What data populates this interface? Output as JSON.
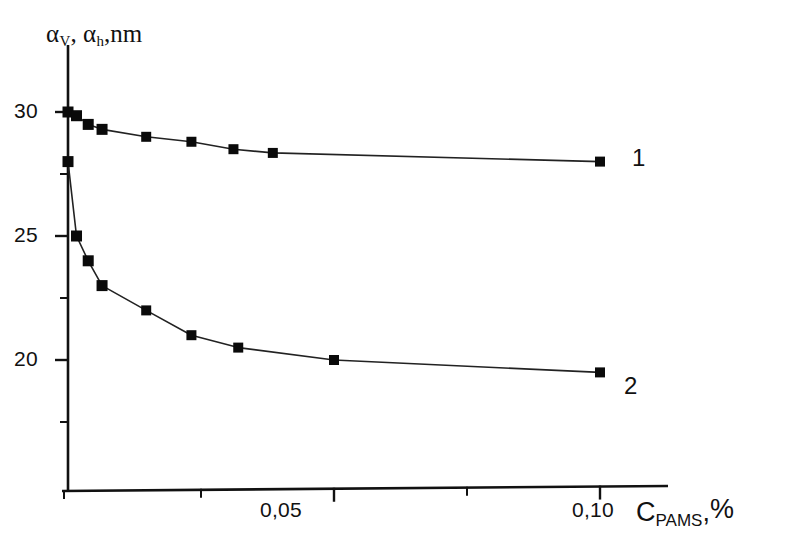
{
  "chart_data": {
    "type": "line",
    "title": "",
    "subtitle": "",
    "xlabel": "C_PAMS, %",
    "ylabel": "alpha_v, alpha_h, nm",
    "xlim": [
      0.0,
      0.1125
    ],
    "ylim": [
      16.25,
      32.0
    ],
    "grid": false,
    "legend_position": "inline-right-end-labels",
    "x_major_ticks": [
      0.05,
      0.1
    ],
    "x_major_tick_labels": [
      "0,05",
      "0,10"
    ],
    "x_minor_ticks": [
      0.025,
      0.075
    ],
    "y_major_ticks": [
      30,
      25,
      20
    ],
    "y_major_tick_labels": [
      "30",
      "25",
      "20"
    ],
    "y_minor_ticks": [
      27.5,
      22.5,
      17.5
    ],
    "series": [
      {
        "name": "1",
        "label": "1",
        "marker": "square",
        "color": "#0a0a0a",
        "x": [
          0.0,
          0.0016,
          0.0038,
          0.0064,
          0.0147,
          0.0232,
          0.0311,
          0.0385,
          0.1
        ],
        "y": [
          30.0,
          29.85,
          29.5,
          29.3,
          29.0,
          28.8,
          28.5,
          28.35,
          28.0
        ]
      },
      {
        "name": "2",
        "label": "2",
        "marker": "square",
        "color": "#0a0a0a",
        "x": [
          0.0,
          0.0016,
          0.0038,
          0.0064,
          0.0147,
          0.0232,
          0.032,
          0.05,
          0.1
        ],
        "y": [
          28.0,
          25.0,
          24.0,
          23.0,
          22.0,
          21.0,
          20.5,
          20.0,
          19.5
        ]
      }
    ]
  },
  "axis_titles": {
    "y_main": "α",
    "y_sub_1": "V",
    "y_mid": ", α",
    "y_sub_2": "h",
    "y_tail": ",nm",
    "x_main": "C",
    "x_sub": "PAMS",
    "x_tail": ",",
    "x_unit": "%"
  },
  "tick_labels": {
    "y_30": "30",
    "y_25": "25",
    "y_20": "20",
    "x_005": "0,05",
    "x_010": "0,10"
  },
  "curve_labels": {
    "one": "1",
    "two": "2"
  },
  "colors": {
    "axis": "#111111",
    "line": "#222222",
    "marker": "#0a0a0a",
    "background": "#ffffff"
  }
}
